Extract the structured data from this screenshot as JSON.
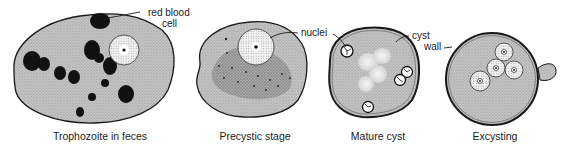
{
  "panels": [
    {
      "id": "trophozoite",
      "caption": "Trophozoite in feces"
    },
    {
      "id": "precystic",
      "caption": "Precystic stage"
    },
    {
      "id": "mature-cyst",
      "caption": "Mature cyst"
    },
    {
      "id": "excysting",
      "caption": "Excysting"
    }
  ],
  "annotations": {
    "red_blood_cell_line1": "red blood",
    "red_blood_cell_line2": "cell",
    "nuclei": "nuclei",
    "cyst_wall_line1": "cyst",
    "cyst_wall_line2": "wall"
  },
  "colors": {
    "cytoplasm": "#bdbdbd",
    "outline": "#1a1a1a",
    "rbc": "#111111",
    "background": "#ffffff"
  }
}
